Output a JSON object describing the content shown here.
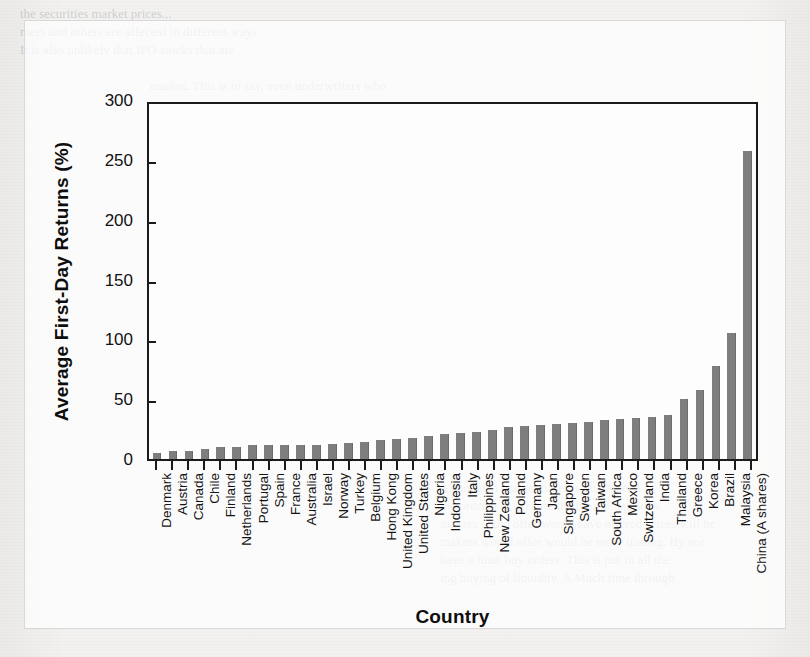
{
  "chart_data": {
    "type": "bar",
    "title": "",
    "xlabel": "Country",
    "ylabel": "Average First-Day Returns (%)",
    "ylim": [
      0,
      300
    ],
    "yticks": [
      0,
      50,
      100,
      150,
      200,
      250,
      300
    ],
    "grid": false,
    "legend": null,
    "bar_color": "#7e7e7e",
    "categories": [
      "Denmark",
      "Austria",
      "Canada",
      "Chile",
      "Finland",
      "Netherlands",
      "Portugal",
      "Spain",
      "France",
      "Australia",
      "Israel",
      "Norway",
      "Turkey",
      "Belgium",
      "Hong Kong",
      "United Kingdom",
      "United States",
      "Nigeria",
      "Indonesia",
      "Italy",
      "Philippines",
      "New Zealand",
      "Poland",
      "Germany",
      "Japan",
      "Singapore",
      "Sweden",
      "Taiwan",
      "South Africa",
      "Mexico",
      "Switzerland",
      "India",
      "Thailand",
      "Greece",
      "Korea",
      "Brazil",
      "Malaysia",
      "China (A shares)"
    ],
    "values": [
      5,
      6.5,
      7,
      8.5,
      10,
      10.2,
      11.5,
      11.8,
      11.6,
      12,
      12.1,
      12.5,
      13,
      14.5,
      15.5,
      16.5,
      17.5,
      19.1,
      21,
      21.5,
      22.5,
      24,
      27,
      27.7,
      28.4,
      29,
      30.5,
      31,
      32.7,
      33.5,
      34.5,
      35.3,
      36.6,
      50,
      58,
      78,
      105,
      257
    ]
  },
  "figure": {
    "panel_label": "figure-panel"
  },
  "page_ghost_text": {
    "top_block": [
      "the securities market prices...",
      "mers and others are affected in different ways",
      "It is also unlikely that IPO stocks that are",
      "market.  This is to say, even underwriters who",
      "evaluate the IPO's auction-related  market in the",
      "on the basis of their estimated worth.  The",
      "its valuation by shares in the new issue market",
      "on the basis of buying.  That is to say, the",
      "other services.  The intermediary ensures that"
    ],
    "heading": "HOW SECURITIES ARE TRADED",
    "bottom_block": [
      "Although a market order is guaranteed",
      "the order will execute the limit order book",
      "makers could offer would have offered prices will be",
      "makers would offer would be more trading.  By not",
      "have a limit buy orders.  This is put in all the",
      "ing buying of liquidity.  A Much time through"
    ]
  }
}
